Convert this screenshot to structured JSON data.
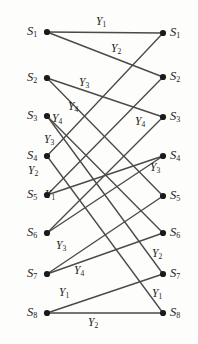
{
  "figure": {
    "background_color": "#fdfdfb",
    "line_color": "#4a4a4a",
    "node_color": "#1a1a1a",
    "text_color": "#1a1a1a"
  },
  "left_nodes": [
    {
      "id": "L1",
      "label": "S",
      "sub": "1",
      "x": 47,
      "y": 32
    },
    {
      "id": "L2",
      "label": "S",
      "sub": "2",
      "x": 47,
      "y": 78
    },
    {
      "id": "L3",
      "label": "S",
      "sub": "3",
      "x": 47,
      "y": 116
    },
    {
      "id": "L4",
      "label": "S",
      "sub": "4",
      "x": 47,
      "y": 156
    },
    {
      "id": "L5",
      "label": "S",
      "sub": "5",
      "x": 47,
      "y": 195
    },
    {
      "id": "L6",
      "label": "S",
      "sub": "6",
      "x": 47,
      "y": 233
    },
    {
      "id": "L7",
      "label": "S",
      "sub": "7",
      "x": 47,
      "y": 274
    },
    {
      "id": "L8",
      "label": "S",
      "sub": "8",
      "x": 47,
      "y": 313
    }
  ],
  "right_nodes": [
    {
      "id": "R1",
      "label": "S",
      "sub": "1",
      "x": 163,
      "y": 33
    },
    {
      "id": "R2",
      "label": "S",
      "sub": "2",
      "x": 163,
      "y": 77
    },
    {
      "id": "R3",
      "label": "S",
      "sub": "3",
      "x": 163,
      "y": 117
    },
    {
      "id": "R4",
      "label": "S",
      "sub": "4",
      "x": 163,
      "y": 156
    },
    {
      "id": "R5",
      "label": "S",
      "sub": "5",
      "x": 163,
      "y": 196
    },
    {
      "id": "R6",
      "label": "S",
      "sub": "6",
      "x": 163,
      "y": 233
    },
    {
      "id": "R7",
      "label": "S",
      "sub": "7",
      "x": 163,
      "y": 274
    },
    {
      "id": "R8",
      "label": "S",
      "sub": "8",
      "x": 163,
      "y": 313
    }
  ],
  "edges": [
    {
      "from": "L1",
      "to": "R1",
      "label": "Y",
      "sub": "1"
    },
    {
      "from": "L1",
      "to": "R2",
      "label": "Y",
      "sub": "2"
    },
    {
      "from": "L2",
      "to": "R3",
      "label": "Y",
      "sub": "3"
    },
    {
      "from": "L2",
      "to": "R5",
      "label": "Y",
      "sub": "4"
    },
    {
      "from": "L3",
      "to": "R6",
      "label": "Y",
      "sub": "4"
    },
    {
      "from": "L3",
      "to": "R7",
      "label": "Y",
      "sub": "3"
    },
    {
      "from": "L4",
      "to": "R1",
      "label": "Y",
      "sub": "2"
    },
    {
      "from": "L4",
      "to": "R8",
      "label": "Y",
      "sub": "1"
    },
    {
      "from": "L5",
      "to": "R2",
      "label": "Y",
      "sub": "1"
    },
    {
      "from": "L5",
      "to": "R4",
      "label": "Y",
      "sub": "3"
    },
    {
      "from": "L6",
      "to": "R3",
      "label": "Y",
      "sub": "4"
    },
    {
      "from": "L6",
      "to": "R4",
      "label": "Y",
      "sub": "3"
    },
    {
      "from": "L7",
      "to": "R5",
      "label": "Y",
      "sub": "3"
    },
    {
      "from": "L7",
      "to": "R6",
      "label": "Y",
      "sub": "4"
    },
    {
      "from": "L8",
      "to": "R7",
      "label": "Y",
      "sub": "1"
    },
    {
      "from": "L8",
      "to": "R8",
      "label": "Y",
      "sub": "2"
    }
  ],
  "edge_labels": [
    {
      "id": "el-1",
      "label": "Y",
      "sub": "1",
      "x": 96,
      "y": 16
    },
    {
      "id": "el-2",
      "label": "Y",
      "sub": "2",
      "x": 111,
      "y": 43
    },
    {
      "id": "el-3",
      "label": "Y",
      "sub": "3",
      "x": 79,
      "y": 77
    },
    {
      "id": "el-4",
      "label": "Y",
      "sub": "4",
      "x": 68,
      "y": 101
    },
    {
      "id": "el-5",
      "label": "Y",
      "sub": "4",
      "x": 52,
      "y": 113
    },
    {
      "id": "el-6",
      "label": "Y",
      "sub": "3",
      "x": 44,
      "y": 134
    },
    {
      "id": "el-7",
      "label": "Y",
      "sub": "4",
      "x": 135,
      "y": 116
    },
    {
      "id": "el-8",
      "label": "Y",
      "sub": "2",
      "x": 28,
      "y": 165
    },
    {
      "id": "el-9",
      "label": "Y",
      "sub": "3",
      "x": 150,
      "y": 162
    },
    {
      "id": "el-10",
      "label": "Y",
      "sub": "1",
      "x": 45,
      "y": 189
    },
    {
      "id": "el-11",
      "label": "Y",
      "sub": "3",
      "x": 56,
      "y": 240
    },
    {
      "id": "el-12",
      "label": "Y",
      "sub": "4",
      "x": 74,
      "y": 265
    },
    {
      "id": "el-13",
      "label": "Y",
      "sub": "2",
      "x": 152,
      "y": 248
    },
    {
      "id": "el-14",
      "label": "Y",
      "sub": "1",
      "x": 59,
      "y": 287
    },
    {
      "id": "el-15",
      "label": "Y",
      "sub": "1",
      "x": 152,
      "y": 288
    },
    {
      "id": "el-16",
      "label": "Y",
      "sub": "2",
      "x": 88,
      "y": 317
    }
  ]
}
